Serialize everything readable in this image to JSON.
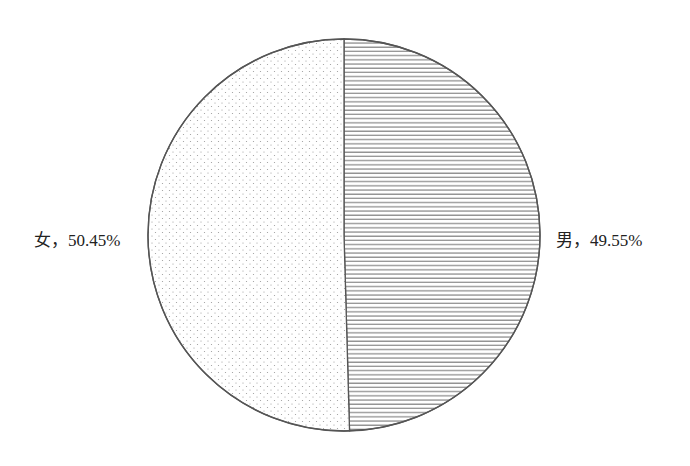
{
  "chart_data": {
    "type": "pie",
    "title": "",
    "categories": [
      "男",
      "女"
    ],
    "values": [
      49.55,
      50.45
    ],
    "unit": "%",
    "labels": [
      "男，49.55%",
      "女，50.45%"
    ],
    "start_angle_deg": 90,
    "direction": "clockwise",
    "fills": [
      {
        "category": "男",
        "pattern": "horizontal-lines",
        "color": "#7a7a7a"
      },
      {
        "category": "女",
        "pattern": "dots",
        "color": "#9a9a9a"
      }
    ],
    "legend": "none",
    "label_position": "outside"
  },
  "colors": {
    "outline": "#555555",
    "background": "#ffffff",
    "text": "#222222"
  },
  "geometry": {
    "cx": 344,
    "cy": 235,
    "r": 196
  },
  "labels": {
    "female": "女，50.45%",
    "male": "男，49.55%"
  }
}
